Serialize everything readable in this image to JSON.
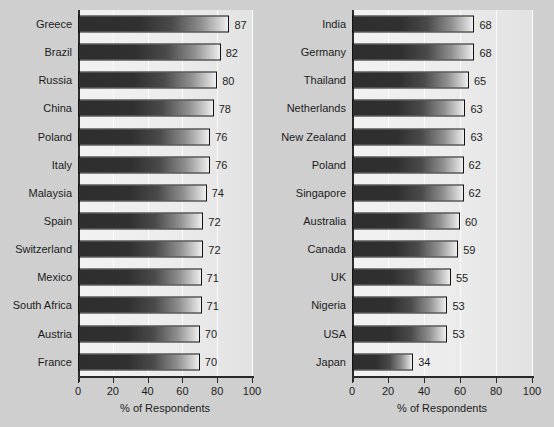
{
  "chart_data": [
    {
      "type": "bar",
      "orientation": "horizontal",
      "title": "",
      "xlabel": "% of Respondents",
      "ylabel": "",
      "xlim": [
        0,
        100
      ],
      "xticks": [
        0,
        20,
        40,
        60,
        80,
        100
      ],
      "xtick_labels": [
        "0",
        "20",
        "40",
        "60",
        "80",
        "100"
      ],
      "grid": true,
      "legend": "none",
      "categories": [
        "Greece",
        "Brazil",
        "Russia",
        "China",
        "Poland",
        "Italy",
        "Malaysia",
        "Spain",
        "Switzerland",
        "Mexico",
        "South Africa",
        "Austria",
        "France"
      ],
      "values": [
        87,
        82,
        80,
        78,
        76,
        76,
        74,
        72,
        72,
        71,
        71,
        70,
        70
      ],
      "data_labels": [
        "87",
        "82",
        "80",
        "78",
        "76",
        "76",
        "74",
        "72",
        "72",
        "71",
        "71",
        "70",
        "70"
      ]
    },
    {
      "type": "bar",
      "orientation": "horizontal",
      "title": "",
      "xlabel": "% of Respondents",
      "ylabel": "",
      "xlim": [
        0,
        100
      ],
      "xticks": [
        0,
        20,
        40,
        60,
        80,
        100
      ],
      "xtick_labels": [
        "0",
        "20",
        "40",
        "60",
        "80",
        "100"
      ],
      "grid": true,
      "legend": "none",
      "categories": [
        "India",
        "Germany",
        "Thailand",
        "Netherlands",
        "New Zealand",
        "Poland",
        "Singapore",
        "Australia",
        "Canada",
        "UK",
        "Nigeria",
        "USA",
        "Japan"
      ],
      "values": [
        68,
        68,
        65,
        63,
        63,
        62,
        62,
        60,
        59,
        55,
        53,
        53,
        34
      ],
      "data_labels": [
        "68",
        "68",
        "65",
        "63",
        "63",
        "62",
        "62",
        "60",
        "59",
        "55",
        "53",
        "53",
        "34"
      ]
    }
  ],
  "colors": {
    "page_background": "#cfcfcf",
    "plot_background": "#efefef",
    "bar_dark": "#2e2e2e",
    "bar_light": "#efefef",
    "axis": "#2a2a2a",
    "gridline": "#fbfbfb",
    "text": "#1c1c1c"
  }
}
